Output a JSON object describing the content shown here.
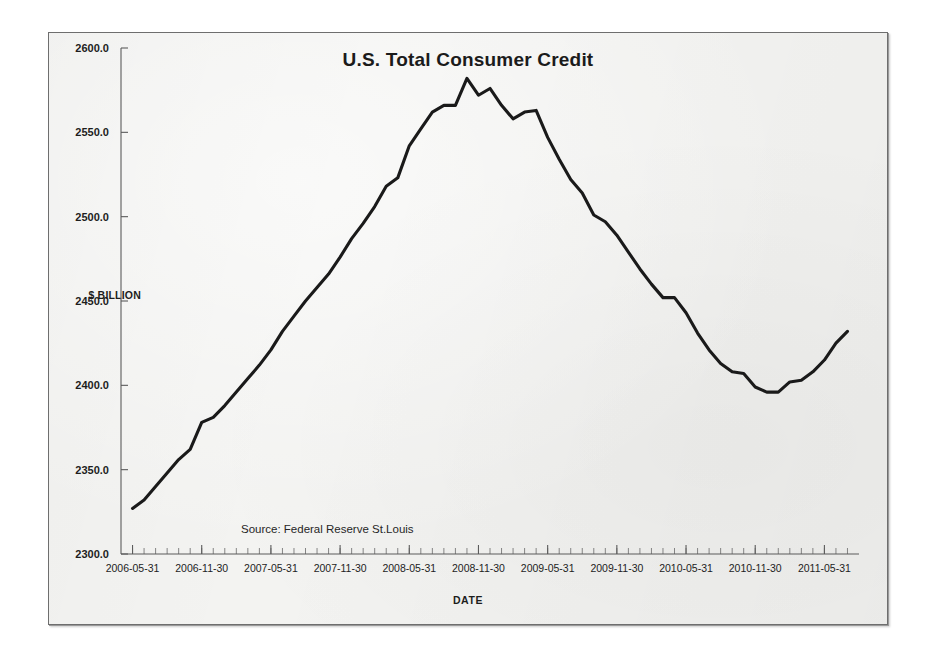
{
  "figure": {
    "title": "U.S. Total Consumer Credit",
    "source_note": "Source: Federal Reserve St.Louis",
    "y_axis_title": "$ BILLION",
    "x_axis_title": "DATE",
    "line_color": "#1a1a1a",
    "background_color": "#f3f3f1",
    "frame_color": "#6e6e6e"
  },
  "chart_data": {
    "type": "line",
    "title": "U.S. Total Consumer Credit",
    "xlabel": "DATE",
    "ylabel": "$ BILLION",
    "ylim": [
      2300.0,
      2600.0
    ],
    "y_ticks": [
      2300.0,
      2350.0,
      2400.0,
      2450.0,
      2500.0,
      2550.0,
      2600.0
    ],
    "y_tick_labels": [
      "2300.0",
      "2350.0",
      "2400.0",
      "2450.0",
      "2500.0",
      "2550.0",
      "2600.0"
    ],
    "x_tick_labels": [
      "2006-05-31",
      "2006-11-30",
      "2007-05-31",
      "2007-11-30",
      "2008-05-31",
      "2008-11-30",
      "2009-05-31",
      "2009-11-30",
      "2010-05-31",
      "2010-11-30",
      "2011-05-31"
    ],
    "x_minor_tick_interval": "1 month",
    "x_major_tick_interval": "6 months",
    "grid": false,
    "legend": false,
    "annotations": [
      "Source: Federal Reserve St.Louis"
    ],
    "series": [
      {
        "name": "U.S. Total Consumer Credit",
        "units": "$ Billion",
        "x": [
          "2006-05-31",
          "2006-06-30",
          "2006-07-31",
          "2006-08-31",
          "2006-09-30",
          "2006-10-31",
          "2006-11-30",
          "2006-12-31",
          "2007-01-31",
          "2007-02-28",
          "2007-03-31",
          "2007-04-30",
          "2007-05-31",
          "2007-06-30",
          "2007-07-31",
          "2007-08-31",
          "2007-09-30",
          "2007-10-31",
          "2007-11-30",
          "2007-12-31",
          "2008-01-31",
          "2008-02-29",
          "2008-03-31",
          "2008-04-30",
          "2008-05-31",
          "2008-06-30",
          "2008-07-31",
          "2008-08-31",
          "2008-09-30",
          "2008-10-31",
          "2008-11-30",
          "2008-12-31",
          "2009-01-31",
          "2009-02-28",
          "2009-03-31",
          "2009-04-30",
          "2009-05-31",
          "2009-06-30",
          "2009-07-31",
          "2009-08-31",
          "2009-09-30",
          "2009-10-31",
          "2009-11-30",
          "2009-12-31",
          "2010-01-31",
          "2010-02-28",
          "2010-03-31",
          "2010-04-30",
          "2010-05-31",
          "2010-06-30",
          "2010-07-31",
          "2010-08-31",
          "2010-09-30",
          "2010-10-31",
          "2010-11-30",
          "2010-12-31",
          "2011-01-31",
          "2011-02-28",
          "2011-03-31",
          "2011-04-30",
          "2011-05-31",
          "2011-06-30",
          "2011-07-31"
        ],
        "values": [
          2327.0,
          2332.0,
          2340.0,
          2348.0,
          2356.0,
          2362.0,
          2378.0,
          2381.0,
          2388.0,
          2396.0,
          2404.0,
          2412.0,
          2421.0,
          2432.0,
          2441.0,
          2450.0,
          2458.0,
          2466.0,
          2476.0,
          2487.0,
          2496.0,
          2506.0,
          2518.0,
          2523.0,
          2542.0,
          2552.0,
          2562.0,
          2566.0,
          2566.0,
          2582.0,
          2572.0,
          2576.0,
          2566.0,
          2558.0,
          2562.0,
          2563.0,
          2547.0,
          2534.0,
          2522.0,
          2514.0,
          2501.0,
          2497.0,
          2489.0,
          2479.0,
          2469.0,
          2460.0,
          2452.0,
          2452.0,
          2443.0,
          2431.0,
          2421.0,
          2413.0,
          2408.0,
          2407.0,
          2399.0,
          2396.0,
          2396.0,
          2402.0,
          2403.0,
          2408.0,
          2415.0,
          2425.0,
          2432.0
        ]
      }
    ],
    "summary": {
      "start_value": 2327.0,
      "peak_value": 2582.0,
      "peak_date": "2008-10-31",
      "trough_value": 2396.0,
      "trough_date": "2010-12-31",
      "end_value": 2452.0
    }
  }
}
